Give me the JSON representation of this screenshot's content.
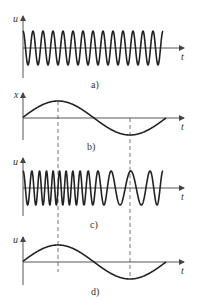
{
  "figure": {
    "panels": [
      {
        "id": "a",
        "label": "a)",
        "y_axis_label": "u",
        "x_axis_label": "t",
        "description": "carrier signal, constant frequency",
        "baseline_y": 48,
        "amplitude": 17,
        "x_start": 23,
        "x_end": 163,
        "cycles": 14
      },
      {
        "id": "b",
        "label": "b)",
        "y_axis_label": "x",
        "x_axis_label": "t",
        "description": "modulating signal, one sine period",
        "baseline_y": 118,
        "amplitude": 17,
        "x_start": 23,
        "x_end": 166
      },
      {
        "id": "c",
        "label": "c)",
        "y_axis_label": "u",
        "x_axis_label": "t",
        "description": "frequency-modulated wave",
        "baseline_y": 188,
        "amplitude": 17,
        "x_start": 23,
        "x_end": 163
      },
      {
        "id": "d",
        "label": "d)",
        "y_axis_label": "u",
        "x_axis_label": "t",
        "description": "demodulated output signal",
        "baseline_y": 262,
        "amplitude": 17,
        "x_start": 23,
        "x_end": 166
      }
    ],
    "guides": {
      "dashed_x_positions": [
        58,
        130
      ]
    },
    "colors": {
      "wave": "#222222",
      "axis": "#444444",
      "text": "#333333",
      "background": "#ffffff"
    }
  }
}
